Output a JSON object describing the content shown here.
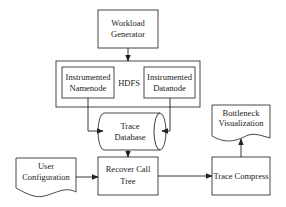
{
  "diagram": {
    "nodes": {
      "workload_generator": {
        "lines": [
          "Workload",
          "Generator"
        ],
        "shape": "rectangle"
      },
      "hdfs": {
        "label": "HDFS",
        "shape": "container"
      },
      "instrumented_namenode": {
        "lines": [
          "Instrumented",
          "Namenode"
        ],
        "shape": "rectangle"
      },
      "instrumented_datanode": {
        "lines": [
          "Instrumented",
          "Datanode"
        ],
        "shape": "rectangle"
      },
      "trace_database": {
        "lines": [
          "Trace",
          "Database"
        ],
        "shape": "cylinder"
      },
      "user_configuration": {
        "lines": [
          "User",
          "Configuration"
        ],
        "shape": "document"
      },
      "recover_call_tree": {
        "lines": [
          "Recover Call",
          "Tree"
        ],
        "shape": "rectangle"
      },
      "trace_compress": {
        "lines": [
          "Trace Compress"
        ],
        "shape": "rectangle"
      },
      "bottleneck_visualization": {
        "lines": [
          "Bottleneck",
          "Visualization"
        ],
        "shape": "document"
      }
    },
    "edges": [
      {
        "from": "workload_generator",
        "to": "hdfs"
      },
      {
        "from": "instrumented_namenode",
        "to": "trace_database"
      },
      {
        "from": "instrumented_datanode",
        "to": "trace_database"
      },
      {
        "from": "trace_database",
        "to": "recover_call_tree"
      },
      {
        "from": "user_configuration",
        "to": "recover_call_tree"
      },
      {
        "from": "recover_call_tree",
        "to": "trace_compress"
      },
      {
        "from": "trace_compress",
        "to": "bottleneck_visualization"
      }
    ]
  }
}
